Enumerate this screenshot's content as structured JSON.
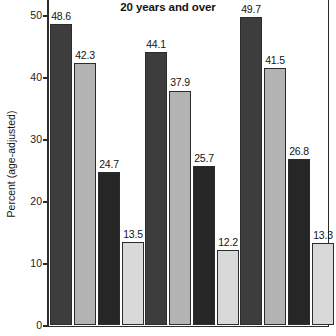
{
  "chart_data": {
    "type": "bar",
    "title": "20 years and over",
    "xlabel": "",
    "ylabel": "Percent (age-adjusted)",
    "ylim": [
      0,
      52.5
    ],
    "yticks": [
      0,
      10,
      20,
      30,
      40,
      50
    ],
    "ytick_labels": [
      "0",
      "10",
      "20",
      "30",
      "40",
      "50"
    ],
    "grid": false,
    "legend": "none",
    "categories": [
      "Group 1",
      "Group 2",
      "Group 3"
    ],
    "series": [
      {
        "name": "Series 1",
        "color": "#3d3d3d",
        "values": [
          48.6,
          44.1,
          49.7
        ],
        "labels": [
          "48.6",
          "44.1",
          "49.7"
        ]
      },
      {
        "name": "Series 2",
        "color": "#b3b3b3",
        "values": [
          42.3,
          37.9,
          41.5
        ],
        "labels": [
          "42.3",
          "37.9",
          "41.5"
        ]
      },
      {
        "name": "Series 3",
        "color": "#262626",
        "values": [
          24.7,
          25.7,
          26.8
        ],
        "labels": [
          "24.7",
          "25.7",
          "26.8"
        ]
      },
      {
        "name": "Series 4",
        "color": "#d9d9d9",
        "values": [
          13.5,
          12.2,
          13.3
        ],
        "labels": [
          "13.5",
          "12.2",
          "13.3"
        ]
      }
    ]
  },
  "colors": {
    "axis": "#2b2b2b",
    "text": "#141414",
    "background": "#ffffff"
  }
}
